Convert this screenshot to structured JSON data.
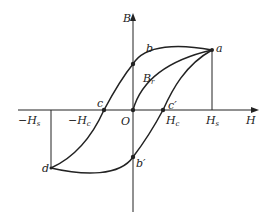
{
  "diagram": {
    "axes": {
      "x_label": "H",
      "y_label": "B",
      "origin_label": "O"
    },
    "tick_labels": {
      "neg_Hs": {
        "main": "−H",
        "sub": "s"
      },
      "neg_Hc": {
        "main": "−H",
        "sub": "c"
      },
      "Hc": {
        "main": "H",
        "sub": "c"
      },
      "Hs": {
        "main": "H",
        "sub": "s"
      },
      "Br": {
        "main": "B",
        "sub": "r"
      }
    },
    "points": {
      "a": "a",
      "b": "b",
      "c": "c",
      "d": "d",
      "b_prime": "b′",
      "c_prime": "c′"
    },
    "colors": {
      "line": "#222222",
      "background": "#ffffff"
    }
  }
}
